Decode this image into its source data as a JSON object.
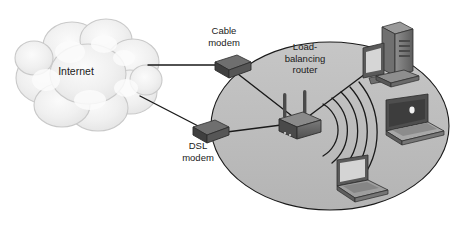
{
  "diagram": {
    "canvas": {
      "width": 458,
      "height": 226
    },
    "colors": {
      "background": "#ffffff",
      "cloud_fill": "#ededed",
      "cloud_stroke": "#bdbdbd",
      "lan_zone_fill": "#bdbdbd",
      "lan_zone_stroke": "#1a1a1a",
      "device_dark": "#4a4a4a",
      "device_mid": "#6e6e6e",
      "device_light": "#9a9a9a",
      "screen_fill": "#d8d8d8",
      "line_stroke": "#1a1a1a",
      "text": "#1a1a1a"
    },
    "labels": {
      "internet": "Internet",
      "cable_modem": "Cable\nmodem",
      "dsl_modem": "DSL\nmodem",
      "load_balancing_router": "Load-\nbalancing\nrouter"
    },
    "nodes": [
      {
        "id": "internet-cloud",
        "name": "internet-cloud",
        "type": "cloud",
        "label": "Internet",
        "cx": 76,
        "cy": 72
      },
      {
        "id": "cable-modem",
        "name": "cable-modem",
        "type": "modem",
        "label": "Cable modem",
        "cx": 231,
        "cy": 66
      },
      {
        "id": "dsl-modem",
        "name": "dsl-modem",
        "type": "modem",
        "label": "DSL modem",
        "cx": 209,
        "cy": 131
      },
      {
        "id": "load-balancing-router",
        "name": "load-balancing-router",
        "type": "router",
        "label": "Load-balancing router",
        "cx": 300,
        "cy": 122,
        "antennas": 2
      },
      {
        "id": "desktop-pc",
        "name": "desktop-computer",
        "type": "desktop",
        "cx": 392,
        "cy": 55
      },
      {
        "id": "laptop-right",
        "name": "laptop-right",
        "type": "laptop",
        "cx": 409,
        "cy": 125
      },
      {
        "id": "laptop-bottom",
        "name": "laptop-bottom",
        "type": "laptop",
        "cx": 358,
        "cy": 186
      }
    ],
    "links": [
      {
        "from": "internet-cloud",
        "to": "cable-modem",
        "kind": "wired"
      },
      {
        "from": "internet-cloud",
        "to": "dsl-modem",
        "kind": "wired"
      },
      {
        "from": "cable-modem",
        "to": "load-balancing-router",
        "kind": "wired"
      },
      {
        "from": "dsl-modem",
        "to": "load-balancing-router",
        "kind": "wired"
      },
      {
        "from": "load-balancing-router",
        "to": "desktop-pc",
        "kind": "wired"
      },
      {
        "from": "load-balancing-router",
        "to": "laptop-right",
        "kind": "wireless"
      },
      {
        "from": "load-balancing-router",
        "to": "laptop-bottom",
        "kind": "wireless"
      }
    ],
    "wireless_arcs": {
      "count": 5,
      "origin_x": 312,
      "origin_y": 130
    },
    "lan_zone": {
      "name": "lan-zone-ellipse",
      "cx": 330,
      "cy": 126,
      "rx": 119,
      "ry": 84
    }
  }
}
